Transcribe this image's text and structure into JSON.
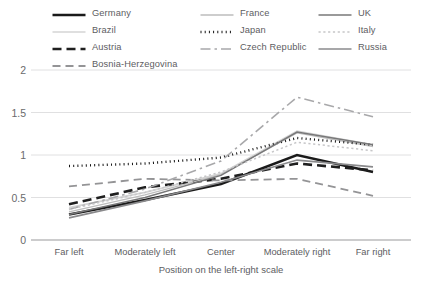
{
  "chart_data": {
    "type": "line",
    "title": "",
    "xlabel": "Position on the left-right scale",
    "ylabel": "",
    "categories": [
      "Far left",
      "Moderately left",
      "Center",
      "Moderately right",
      "Far right"
    ],
    "ylim": [
      0,
      2
    ],
    "yticks": [
      "0",
      "0.5",
      "1",
      "1.5",
      "2"
    ],
    "ytick_values": [
      0,
      0.5,
      1,
      1.5,
      2
    ],
    "grid": true,
    "legend_position": "top",
    "series": [
      {
        "name": "Germany",
        "values": [
          0.3,
          0.47,
          0.66,
          1.0,
          0.8
        ],
        "color": "#1a1a1a",
        "width": 2.6,
        "dash": "none"
      },
      {
        "name": "Brazil",
        "values": [
          0.38,
          0.56,
          0.78,
          1.28,
          1.12
        ],
        "color": "#d4d4d4",
        "width": 1.7,
        "dash": "none"
      },
      {
        "name": "Austria",
        "values": [
          0.42,
          0.62,
          0.72,
          0.9,
          0.82
        ],
        "color": "#1f1f1f",
        "width": 2.6,
        "dash": "9,5"
      },
      {
        "name": "Bosnia-Herzegovina",
        "values": [
          0.63,
          0.72,
          0.7,
          0.72,
          0.52
        ],
        "color": "#949496",
        "width": 1.8,
        "dash": "8,5"
      },
      {
        "name": "France",
        "values": [
          0.33,
          0.53,
          0.77,
          1.26,
          1.1
        ],
        "color": "#bdbdbd",
        "width": 1.3,
        "dash": "none"
      },
      {
        "name": "Japan",
        "values": [
          0.87,
          0.9,
          0.97,
          1.2,
          1.12
        ],
        "color": "#141414",
        "width": 2.4,
        "dash": "1,3.2"
      },
      {
        "name": "Czech Republic",
        "values": [
          0.36,
          0.6,
          0.93,
          1.68,
          1.45
        ],
        "color": "#a8a8aa",
        "width": 1.6,
        "dash": "10,4,2.5,4"
      },
      {
        "name": "UK",
        "values": [
          0.3,
          0.5,
          0.76,
          1.27,
          1.12
        ],
        "color": "#787879",
        "width": 1.5,
        "dash": "none"
      },
      {
        "name": "Italy",
        "values": [
          0.36,
          0.56,
          0.8,
          1.15,
          1.05
        ],
        "color": "#c6c6c8",
        "width": 1.5,
        "dash": "2.2,2.6"
      },
      {
        "name": "Russia",
        "values": [
          0.26,
          0.46,
          0.68,
          0.94,
          0.86
        ],
        "color": "#8a8a8c",
        "width": 1.6,
        "dash": "none"
      }
    ]
  },
  "legend": {
    "columns": [
      [
        "Germany",
        "Brazil",
        "Austria",
        "Bosnia-Herzegovina"
      ],
      [
        "France",
        "Japan",
        "Czech Republic"
      ],
      [
        "UK",
        "Italy",
        "Russia"
      ]
    ]
  }
}
